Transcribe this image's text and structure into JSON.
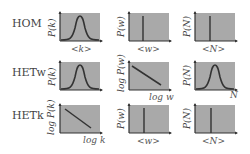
{
  "rows": [
    {
      "label": "HOM",
      "panels": [
        {
          "ylabel": "P(k)",
          "xlabel": "<k>",
          "shape": "gaussian"
        },
        {
          "ylabel": "P(w)",
          "xlabel": "<w>",
          "shape": "delta"
        },
        {
          "ylabel": "P(N)",
          "xlabel": "<N>",
          "shape": "delta"
        }
      ]
    },
    {
      "label": "HETw",
      "panels": [
        {
          "ylabel": "P(k)",
          "xlabel": "",
          "shape": "gaussian"
        },
        {
          "ylabel": "log P(w)",
          "xlabel": "log w",
          "shape": "powerlaw"
        },
        {
          "ylabel": "P(N)",
          "xlabel": "N",
          "shape": "gaussian"
        }
      ]
    },
    {
      "label": "HETk",
      "panels": [
        {
          "ylabel": "log P(k)",
          "xlabel": "log k",
          "shape": "powerlaw"
        },
        {
          "ylabel": "P(w)",
          "xlabel": "<w>",
          "shape": "delta"
        },
        {
          "ylabel": "P(N)",
          "xlabel": "<N>",
          "shape": "delta"
        }
      ]
    }
  ],
  "colors": {
    "box_fill": "#a9a9a9",
    "curve": "#333333",
    "axis": "#333333"
  }
}
